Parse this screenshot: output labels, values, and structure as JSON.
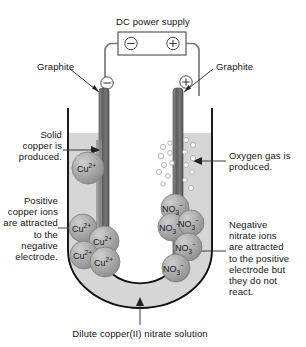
{
  "diagram": {
    "title_caption": "Dilute copper(II) nitrate solution",
    "power_supply": {
      "label": "DC power supply",
      "negative_terminal": "⊖",
      "positive_terminal": "⊕"
    },
    "electrodes": {
      "left": {
        "material_label": "Graphite",
        "polarity_symbol": "⊖",
        "polarity": "negative"
      },
      "right": {
        "material_label": "Graphite",
        "polarity_symbol": "⊕",
        "polarity": "positive"
      }
    },
    "annotations": {
      "solid_copper": "Solid\ncopper is\nproduced.",
      "positive_ions": "Positive\ncopper ions\nare attracted\nto the\nnegative\nelectrode.",
      "oxygen_gas": "Oxygen gas is\nproduced.",
      "negative_ions": "Negative\nnitrate ions\nare attracted\nto the positive\nelectrode but\nthey do not\nreact."
    },
    "species": {
      "copper_ion_label": "Cu",
      "copper_ion_charge": "2+",
      "nitrate_label": "NO",
      "nitrate_sub": "3",
      "nitrate_charge": "−"
    },
    "copper_ions": [
      {
        "x": 88,
        "y": 168,
        "r": 16,
        "text": "Cu2+"
      },
      {
        "x": 83,
        "y": 228,
        "r": 14,
        "text": "Cu2+"
      },
      {
        "x": 104,
        "y": 241,
        "r": 15,
        "text": "Cu2+"
      },
      {
        "x": 84,
        "y": 255,
        "r": 14,
        "text": "Cu2+"
      },
      {
        "x": 105,
        "y": 262,
        "r": 15,
        "text": "Cu2+"
      }
    ],
    "nitrate_ions": [
      {
        "x": 175,
        "y": 208,
        "r": 14,
        "text": "NO3-"
      },
      {
        "x": 172,
        "y": 227,
        "r": 14,
        "text": "NO3-"
      },
      {
        "x": 191,
        "y": 223,
        "r": 13,
        "text": "NO3-"
      },
      {
        "x": 188,
        "y": 247,
        "r": 14,
        "text": "NO3-"
      },
      {
        "x": 176,
        "y": 268,
        "r": 14,
        "text": "NO3-"
      }
    ],
    "oxygen_bubbles": [
      {
        "x": 163,
        "y": 147,
        "r": 2.6
      },
      {
        "x": 170,
        "y": 143,
        "r": 2.2
      },
      {
        "x": 161,
        "y": 156,
        "r": 2.8
      },
      {
        "x": 170,
        "y": 153,
        "r": 2.4
      },
      {
        "x": 164,
        "y": 165,
        "r": 2.6
      },
      {
        "x": 172,
        "y": 163,
        "r": 2.3
      },
      {
        "x": 159,
        "y": 172,
        "r": 2.5
      },
      {
        "x": 168,
        "y": 176,
        "r": 2.4
      },
      {
        "x": 163,
        "y": 184,
        "r": 2.2
      },
      {
        "x": 186,
        "y": 140,
        "r": 2.5
      },
      {
        "x": 193,
        "y": 145,
        "r": 2.6
      },
      {
        "x": 185,
        "y": 152,
        "r": 2.4
      },
      {
        "x": 193,
        "y": 158,
        "r": 2.7
      },
      {
        "x": 186,
        "y": 165,
        "r": 2.5
      },
      {
        "x": 192,
        "y": 172,
        "r": 2.4
      },
      {
        "x": 185,
        "y": 180,
        "r": 2.3
      },
      {
        "x": 191,
        "y": 188,
        "r": 2.5
      }
    ],
    "colors": {
      "solution": "#d6d6d6",
      "glass_outline": "#1a1a1a",
      "electrode": "#6e6e6e",
      "ion_fill": "#a8a8a8",
      "wire": "#6b6b6b",
      "text": "#141414"
    }
  }
}
